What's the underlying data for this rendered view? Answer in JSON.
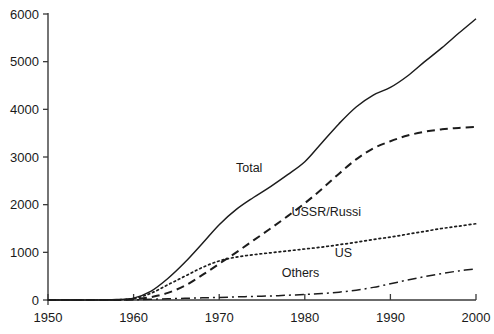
{
  "chart_data": {
    "type": "line",
    "title": "",
    "subtitle": "",
    "xlabel": "",
    "ylabel": "",
    "xlim": [
      1950,
      2000
    ],
    "ylim": [
      0,
      6000
    ],
    "grid": false,
    "legend_position": "inline-annotations",
    "x_ticks": [
      1950,
      1960,
      1970,
      1980,
      1990,
      2000
    ],
    "y_ticks": [
      0,
      1000,
      2000,
      3000,
      4000,
      5000,
      6000
    ],
    "x_tick_labels": [
      "1950",
      "1960",
      "1970",
      "1980",
      "1990",
      "2000"
    ],
    "y_tick_labels": [
      "0",
      "1000",
      "2000",
      "3000",
      "4000",
      "5000",
      "6000"
    ],
    "x": [
      1950,
      1955,
      1958,
      1960,
      1962,
      1964,
      1966,
      1968,
      1970,
      1972,
      1974,
      1976,
      1978,
      1980,
      1982,
      1984,
      1986,
      1988,
      1990,
      1992,
      1994,
      1996,
      1998,
      2000
    ],
    "series": [
      {
        "name": "Total",
        "label": "Total",
        "style": "solid",
        "color": "#1c1c1c",
        "values": [
          0,
          0,
          10,
          40,
          180,
          450,
          790,
          1180,
          1580,
          1900,
          2150,
          2380,
          2630,
          2900,
          3300,
          3700,
          4050,
          4300,
          4460,
          4700,
          5000,
          5290,
          5600,
          5900
        ]
      },
      {
        "name": "USSR/Russia",
        "label": "USSR/Russi",
        "style": "dashed",
        "color": "#1c1c1c",
        "values": [
          0,
          0,
          0,
          15,
          60,
          150,
          300,
          520,
          760,
          1000,
          1250,
          1500,
          1760,
          2030,
          2330,
          2650,
          2950,
          3180,
          3330,
          3450,
          3530,
          3580,
          3610,
          3630
        ]
      },
      {
        "name": "US",
        "label": "US",
        "style": "dotted",
        "color": "#1c1c1c",
        "values": [
          0,
          0,
          5,
          30,
          140,
          320,
          500,
          680,
          820,
          900,
          950,
          990,
          1030,
          1070,
          1110,
          1160,
          1210,
          1270,
          1320,
          1380,
          1440,
          1500,
          1550,
          1600
        ]
      },
      {
        "name": "Others",
        "label": "Others",
        "style": "dashdot",
        "color": "#1c1c1c",
        "values": [
          0,
          0,
          0,
          5,
          15,
          25,
          35,
          45,
          55,
          65,
          75,
          85,
          100,
          115,
          135,
          165,
          205,
          265,
          340,
          420,
          490,
          555,
          610,
          655
        ]
      }
    ],
    "annotations": [
      {
        "text": "Total",
        "x": 1973.5,
        "y": 2680
      },
      {
        "text": "USSR/Russi",
        "x": 1982.5,
        "y": 1760
      },
      {
        "text": "US",
        "x": 1984.5,
        "y": 900
      },
      {
        "text": "Others",
        "x": 1979.5,
        "y": 490
      }
    ]
  }
}
